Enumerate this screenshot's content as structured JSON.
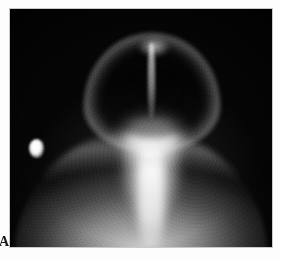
{
  "figure": {
    "panel_label": "A",
    "modality": "nuclear-medicine-scintigraphy",
    "view": "anterior head and neck",
    "background_color": "#ffffff",
    "frame_color": "#050505",
    "border_color": "#c9c9c9"
  },
  "scan": {
    "field_label": "gamma-camera-field",
    "anatomy": [
      {
        "name": "cranial-vault",
        "uptake": "peripheral rim, photopenic interior"
      },
      {
        "name": "sagittal-suture",
        "uptake": "midline linear increased"
      },
      {
        "name": "vertex",
        "uptake": "focal increased"
      },
      {
        "name": "skull-base-facial-bones",
        "uptake": "intense"
      },
      {
        "name": "cervical-spine",
        "uptake": "increased linear"
      },
      {
        "name": "neck-soft-tissue",
        "uptake": "moderate"
      },
      {
        "name": "shoulders-upper-thorax",
        "uptake": "moderate broad arc"
      }
    ],
    "marker": {
      "name": "focal-hot-spot-marker",
      "position": "left field, mid height",
      "intensity": "maximal"
    }
  }
}
